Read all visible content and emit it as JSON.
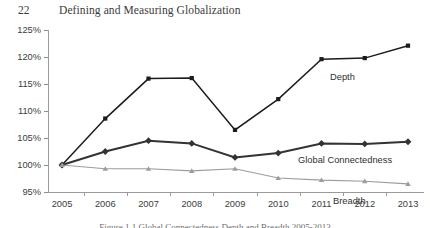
{
  "header": {
    "page_number": "22",
    "running_head": "Defining and Measuring Globalization"
  },
  "caption": "Figure 1.1 Global Connectedness Depth and Breadth 2005-2013",
  "series_labels": {
    "depth": "Depth",
    "global_connectedness": "Global Connectedness",
    "breadth": "Breadth"
  },
  "colors": {
    "depth": "#1c1c1c",
    "global_connectedness": "#333333",
    "breadth": "#9c9c9c",
    "axis": "#9a9a9a",
    "text": "#3c3c3c"
  },
  "chart_data": {
    "type": "line",
    "title": "",
    "xlabel": "",
    "ylabel": "",
    "ylim": [
      95,
      125
    ],
    "yticks": [
      95,
      100,
      105,
      110,
      115,
      120,
      125
    ],
    "ytick_labels": [
      "95%",
      "100%",
      "105%",
      "110%",
      "115%",
      "120%",
      "125%"
    ],
    "categories": [
      "2005",
      "2006",
      "2007",
      "2008",
      "2009",
      "2010",
      "2011",
      "2012",
      "2013"
    ],
    "x": [
      2005,
      2006,
      2007,
      2008,
      2009,
      2010,
      2011,
      2012,
      2013
    ],
    "grid": false,
    "legend_position": "inline-labels",
    "series": [
      {
        "name": "Depth",
        "marker": "square",
        "values": [
          100,
          108.6,
          116.0,
          116.1,
          106.5,
          112.2,
          119.6,
          119.8,
          122.1
        ]
      },
      {
        "name": "Global Connectedness",
        "marker": "diamond",
        "values": [
          100,
          102.5,
          104.5,
          104.0,
          101.4,
          102.2,
          104.0,
          103.9,
          104.3
        ]
      },
      {
        "name": "Breadth",
        "marker": "triangle",
        "values": [
          100,
          99.3,
          99.3,
          98.9,
          99.3,
          97.6,
          97.2,
          97.0,
          96.5
        ]
      }
    ]
  }
}
